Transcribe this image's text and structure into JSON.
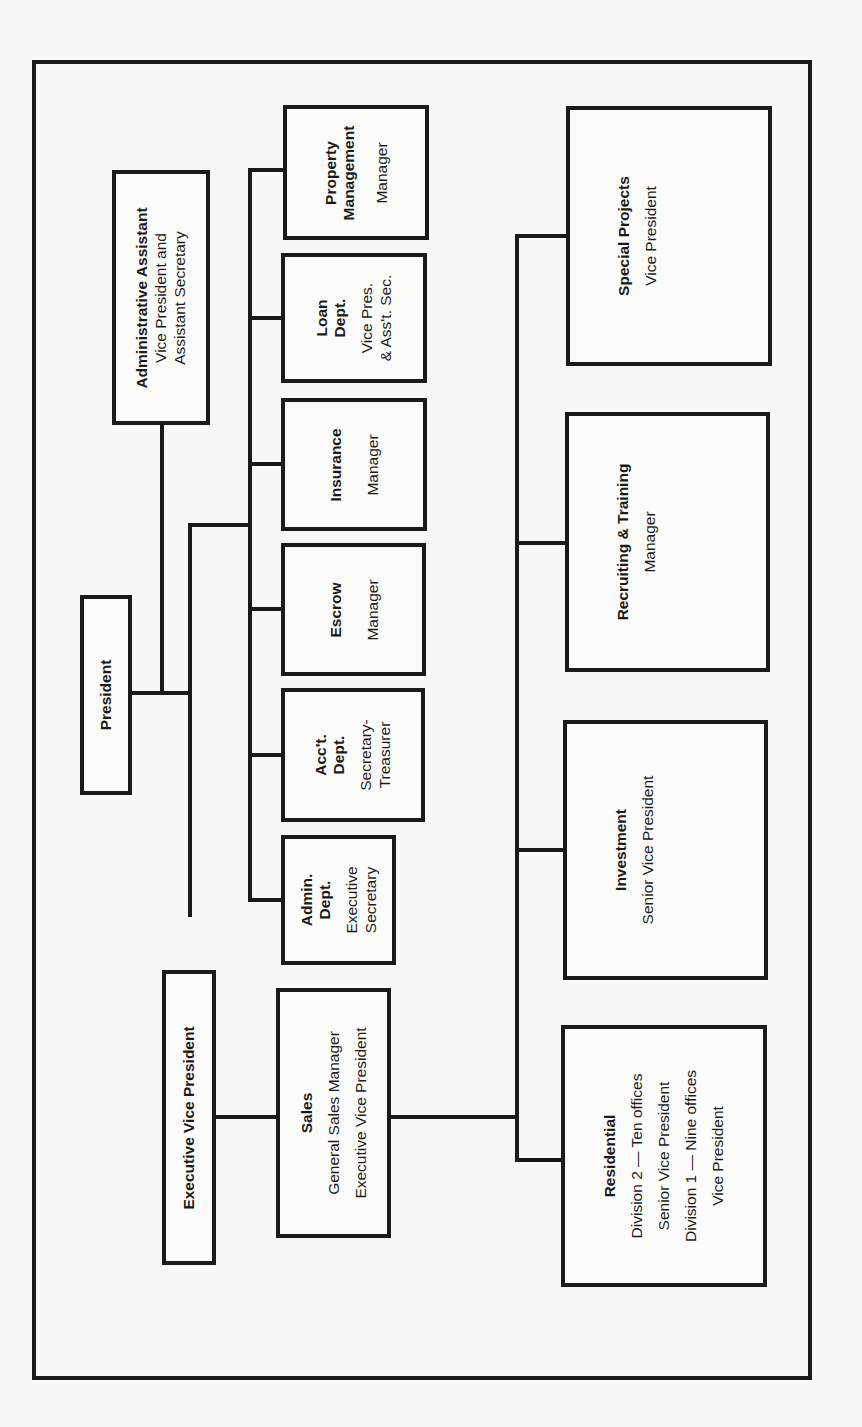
{
  "chart": {
    "orientation": "rotated-90-ccw",
    "president": {
      "title": "President"
    },
    "admin_assistant": {
      "title": "Administrative Assistant",
      "lines": [
        "Vice President and",
        "Assistant Secretary"
      ]
    },
    "exec_vp": {
      "title": "Executive Vice President"
    },
    "departments": [
      {
        "title_lines": [
          "Admin.",
          "Dept."
        ],
        "lines": [
          "Executive",
          "Secretary"
        ]
      },
      {
        "title_lines": [
          "Acc't.",
          "Dept."
        ],
        "lines": [
          "Secretary-",
          "Treasurer"
        ]
      },
      {
        "title_lines": [
          "Escrow"
        ],
        "lines": [
          "Manager"
        ]
      },
      {
        "title_lines": [
          "Insurance"
        ],
        "lines": [
          "Manager"
        ]
      },
      {
        "title_lines": [
          "Loan",
          "Dept."
        ],
        "lines": [
          "Vice Pres.",
          "& Ass't. Sec."
        ]
      },
      {
        "title_lines": [
          "Property",
          "Management"
        ],
        "lines": [
          "Manager"
        ]
      }
    ],
    "sales": {
      "title": "Sales",
      "lines": [
        "General Sales Manager",
        "Executive Vice President"
      ]
    },
    "sales_units": [
      {
        "title": "Residential",
        "lines": [
          "Division 2 — Ten offices",
          "Senior Vice President",
          "Division 1 — Nine offices",
          "Vice President"
        ]
      },
      {
        "title": "Investment",
        "lines": [
          "Senior Vice President"
        ]
      },
      {
        "title": "Recruiting & Training",
        "lines": [
          "Manager"
        ]
      },
      {
        "title": "Special Projects",
        "lines": [
          "Vice President"
        ]
      }
    ]
  }
}
